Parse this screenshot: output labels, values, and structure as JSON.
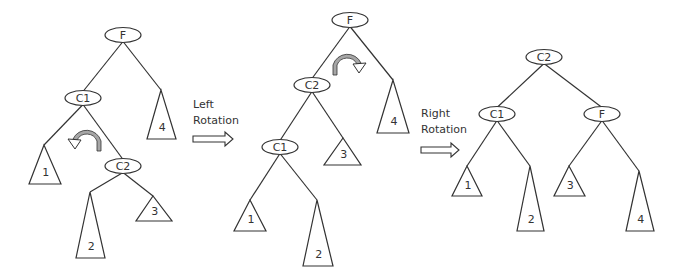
{
  "diagram": {
    "type": "tree-rotation",
    "colors": {
      "line": "#333333",
      "arc_fill": "#a6a6a6",
      "background": "#ffffff"
    },
    "steps": [
      {
        "id": "before",
        "nodes": [
          {
            "id": "F",
            "label": "F",
            "x": 123,
            "y": 35
          },
          {
            "id": "C1",
            "label": "C1",
            "x": 83,
            "y": 98
          },
          {
            "id": "C2",
            "label": "C2",
            "x": 123,
            "y": 166
          }
        ],
        "subtrees": [
          {
            "label": "4",
            "apex": [
              161,
              90
            ],
            "base_y": 139,
            "base_x": [
              147,
              176
            ]
          },
          {
            "label": "1",
            "apex": [
              44,
              145
            ],
            "base_y": 184,
            "base_x": [
              29,
              61
            ]
          },
          {
            "label": "2",
            "apex": [
              90,
              192
            ],
            "base_y": 258,
            "base_x": [
              76,
              105
            ]
          },
          {
            "label": "3",
            "apex": [
              153,
              196
            ],
            "base_y": 221,
            "base_x": [
              136,
              172
            ]
          }
        ],
        "rotation_hint": {
          "direction": "counter-clockwise",
          "around": "C1"
        }
      },
      {
        "id": "after-left",
        "nodes": [
          {
            "id": "F",
            "label": "F",
            "x": 350,
            "y": 20
          },
          {
            "id": "C2",
            "label": "C2",
            "x": 312,
            "y": 85
          },
          {
            "id": "C1",
            "label": "C1",
            "x": 280,
            "y": 147
          }
        ],
        "subtrees": [
          {
            "label": "4",
            "apex": [
              393,
              80
            ],
            "base_y": 133,
            "base_x": [
              377,
              409
            ]
          },
          {
            "label": "3",
            "apex": [
              343,
              138
            ],
            "base_y": 165,
            "base_x": [
              324,
              361
            ]
          },
          {
            "label": "1",
            "apex": [
              250,
              200
            ],
            "base_y": 231,
            "base_x": [
              234,
              266
            ]
          },
          {
            "label": "2",
            "apex": [
              317,
              200
            ],
            "base_y": 266,
            "base_x": [
              303,
              333
            ]
          }
        ],
        "rotation_hint": {
          "direction": "clockwise",
          "around": "F"
        }
      },
      {
        "id": "after-right",
        "nodes": [
          {
            "id": "C2",
            "label": "C2",
            "x": 544,
            "y": 57
          },
          {
            "id": "C1",
            "label": "C1",
            "x": 497,
            "y": 114
          },
          {
            "id": "F",
            "label": "F",
            "x": 602,
            "y": 114
          }
        ],
        "subtrees": [
          {
            "label": "1",
            "apex": [
              467,
              166
            ],
            "base_y": 196,
            "base_x": [
              452,
              482
            ]
          },
          {
            "label": "2",
            "apex": [
              530,
              166
            ],
            "base_y": 231,
            "base_x": [
              517,
              544
            ]
          },
          {
            "label": "3",
            "apex": [
              569,
              166
            ],
            "base_y": 196,
            "base_x": [
              554,
              585
            ]
          },
          {
            "label": "4",
            "apex": [
              639,
              171
            ],
            "base_y": 231,
            "base_x": [
              626,
              654
            ]
          }
        ]
      }
    ],
    "transitions": [
      {
        "line1": "Left",
        "line2": "Rotation",
        "text_x": 193,
        "text_y": 98,
        "arrow": [
          193,
          233,
          139
        ]
      },
      {
        "line1": "Right",
        "line2": "Rotation",
        "text_x": 421,
        "text_y": 107,
        "arrow": [
          421,
          459,
          150
        ]
      }
    ]
  }
}
